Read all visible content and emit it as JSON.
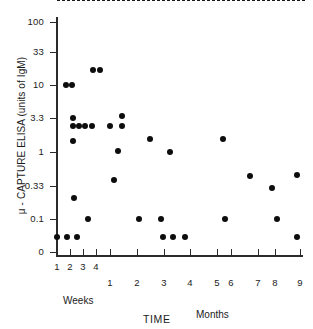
{
  "chart_data": {
    "type": "scatter",
    "title": "",
    "xlabel": "TIME",
    "ylabel": "μ - CAPTURE ELISA (units of IgM)",
    "yscale": "log",
    "ylim": [
      0,
      100
    ],
    "grid": false,
    "legend": "none",
    "y_ticks": [
      {
        "label": "100",
        "value": 100,
        "py": 22
      },
      {
        "label": "33",
        "value": 33,
        "py": 52
      },
      {
        "label": "10",
        "value": 10,
        "py": 85
      },
      {
        "label": "3.3",
        "value": 3.3,
        "py": 118
      },
      {
        "label": "1",
        "value": 1,
        "py": 152
      },
      {
        "label": "0.33",
        "value": 0.33,
        "py": 186
      },
      {
        "label": "0.1",
        "value": 0.1,
        "py": 219
      },
      {
        "label": "0",
        "value": 0,
        "py": 252
      }
    ],
    "x_ticks": [
      {
        "label": "1",
        "group": "Weeks",
        "px": 57
      },
      {
        "label": "2",
        "group": "Weeks",
        "px": 70
      },
      {
        "label": "3",
        "group": "Weeks",
        "px": 83
      },
      {
        "label": "4",
        "group": "Weeks",
        "px": 96
      },
      {
        "label": "1",
        "group": "Months",
        "px": 110
      },
      {
        "label": "2",
        "group": "Months",
        "px": 137
      },
      {
        "label": "3",
        "group": "Months",
        "px": 164
      },
      {
        "label": "4",
        "group": "Months",
        "px": 190
      },
      {
        "label": "5",
        "group": "Months",
        "px": 217
      },
      {
        "label": "6",
        "group": "Months",
        "px": 231
      },
      {
        "label": "7",
        "group": "Months",
        "px": 258
      },
      {
        "label": "8",
        "group": "Months",
        "px": 275
      },
      {
        "label": "9",
        "group": "Months",
        "px": 300
      }
    ],
    "group_labels": {
      "weeks": "Weeks",
      "months": "Months"
    },
    "annotations": [
      {
        "type": "hline",
        "label": "cutoff",
        "value": 0.33,
        "style": "dashed",
        "py": 186
      }
    ],
    "points": [
      {
        "x_label": "1 week",
        "y": 0.05,
        "px": 57,
        "py": 237
      },
      {
        "x_label": "1 week",
        "y": 10,
        "px": 66,
        "py": 85
      },
      {
        "x_label": "1 week",
        "y": 0.05,
        "px": 67,
        "py": 237
      },
      {
        "x_label": "2 weeks",
        "y": 10,
        "px": 72,
        "py": 85
      },
      {
        "x_label": "2 weeks",
        "y": 3.3,
        "px": 73,
        "py": 118
      },
      {
        "x_label": "2 weeks",
        "y": 2.4,
        "px": 73,
        "py": 126
      },
      {
        "x_label": "2 weeks",
        "y": 1.7,
        "px": 73,
        "py": 141
      },
      {
        "x_label": "2 weeks",
        "y": 0.22,
        "px": 74,
        "py": 198
      },
      {
        "x_label": "2 weeks",
        "y": 0.05,
        "px": 77,
        "py": 237
      },
      {
        "x_label": "2 weeks",
        "y": 2.4,
        "px": 79,
        "py": 126
      },
      {
        "x_label": "2 weeks",
        "y": 2.4,
        "px": 85,
        "py": 126
      },
      {
        "x_label": "3 weeks",
        "y": 0.1,
        "px": 88,
        "py": 219
      },
      {
        "x_label": "3 weeks",
        "y": 2.4,
        "px": 92,
        "py": 126
      },
      {
        "x_label": "3 weeks",
        "y": 17,
        "px": 93,
        "py": 70
      },
      {
        "x_label": "3 weeks",
        "y": 17,
        "px": 100,
        "py": 70
      },
      {
        "x_label": "4 weeks",
        "y": 2.4,
        "px": 110,
        "py": 126
      },
      {
        "x_label": "4 weeks",
        "y": 0.4,
        "px": 114,
        "py": 180
      },
      {
        "x_label": "4 weeks",
        "y": 1.05,
        "px": 118,
        "py": 151
      },
      {
        "x_label": "1 month",
        "y": 3.5,
        "px": 122,
        "py": 116
      },
      {
        "x_label": "1 month",
        "y": 2.4,
        "px": 122,
        "py": 126
      },
      {
        "x_label": "2 months",
        "y": 0.1,
        "px": 139,
        "py": 219
      },
      {
        "x_label": "2 months",
        "y": 1.7,
        "px": 150,
        "py": 139
      },
      {
        "x_label": "3 months",
        "y": 0.1,
        "px": 161,
        "py": 219
      },
      {
        "x_label": "3 months",
        "y": 0.05,
        "px": 163,
        "py": 237
      },
      {
        "x_label": "3 months",
        "y": 0.05,
        "px": 173,
        "py": 237
      },
      {
        "x_label": "3.5 months",
        "y": 1.0,
        "px": 170,
        "py": 152
      },
      {
        "x_label": "4 months",
        "y": 0.05,
        "px": 185,
        "py": 237
      },
      {
        "x_label": "6 months",
        "y": 1.7,
        "px": 223,
        "py": 139
      },
      {
        "x_label": "6 months",
        "y": 0.1,
        "px": 225,
        "py": 219
      },
      {
        "x_label": "7 months",
        "y": 0.45,
        "px": 250,
        "py": 176
      },
      {
        "x_label": "8 months",
        "y": 0.32,
        "px": 272,
        "py": 188
      },
      {
        "x_label": "8 months",
        "y": 0.1,
        "px": 277,
        "py": 219
      },
      {
        "x_label": "9 months",
        "y": 0.45,
        "px": 297,
        "py": 175
      },
      {
        "x_label": "9 months",
        "y": 0.05,
        "px": 297,
        "py": 237
      }
    ]
  }
}
